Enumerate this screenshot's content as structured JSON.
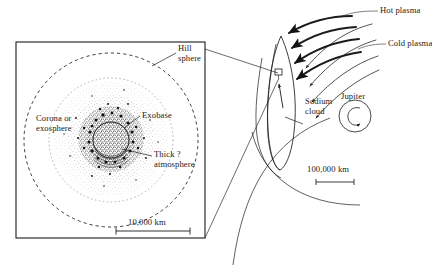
{
  "figure": {
    "background_color": "#ffffff",
    "ink_color": "#1a1a1a"
  },
  "left_panel": {
    "name": "io-atmosphere-detail",
    "frame": {
      "x": 16,
      "y": 42,
      "width": 189,
      "height": 196
    },
    "labels": {
      "hill_sphere": "Hill\nsphere",
      "corona": "Corona or\nexosphere",
      "exobase": "Exobase",
      "thick_atmosphere": "Thick ?\natmosphere"
    },
    "scale_bar": {
      "label": "10,000 km",
      "length_px": 52
    },
    "features": {
      "hill_sphere_style": "dashed-circle",
      "body_style": "white-disk",
      "corona_style": "stippled-cloud"
    }
  },
  "right_panel": {
    "name": "jupiter-system-overview",
    "labels": {
      "hot_plasma": "Hot plasma",
      "cold_plasma": "Cold plasma",
      "sodium_cloud": "Sodium\ncloud",
      "jupiter": "Jupiter"
    },
    "scale_bar": {
      "label": "100,000 km",
      "length_px": 38
    },
    "features": {
      "hot_plasma_arrows": 4,
      "cold_plasma_streamlines": 4,
      "sodium_cloud_style": "elongated-crescent",
      "io_marker_style": "small-box",
      "jupiter_style": "circle-with-spiral",
      "orbit_style": "large-arc"
    }
  },
  "colors": {
    "ink": "#1a1a1a",
    "paper": "#ffffff",
    "light_ink": "#555555"
  }
}
